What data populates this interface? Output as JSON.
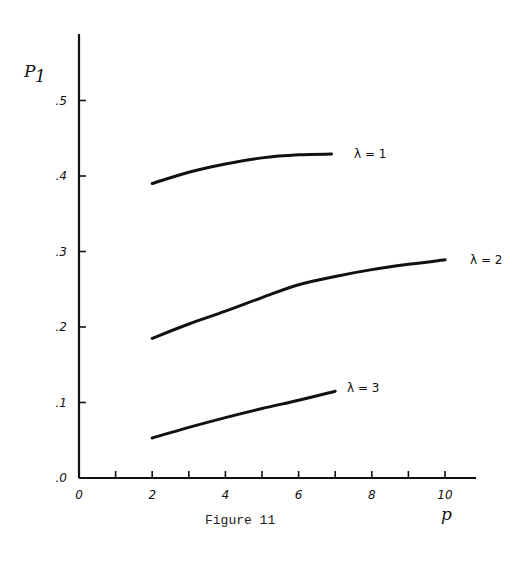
{
  "chart_data": {
    "type": "line",
    "title": "",
    "caption": "Figure 11",
    "xlabel": "p",
    "ylabel": "P1",
    "ylabel_main": "P",
    "ylabel_sub": "1",
    "xlim": [
      0,
      11
    ],
    "ylim": [
      0,
      0.58
    ],
    "grid": false,
    "x_ticks": [
      0,
      1,
      2,
      3,
      4,
      5,
      6,
      7,
      8,
      9,
      10
    ],
    "x_tick_labels": [
      "0",
      "",
      "2",
      "",
      "4",
      "",
      "6",
      "",
      "8",
      "",
      "10"
    ],
    "y_ticks": [
      0,
      0.1,
      0.2,
      0.3,
      0.4,
      0.5
    ],
    "y_tick_labels": [
      ".0",
      ".1",
      ".2",
      ".3",
      ".4",
      ".5"
    ],
    "series": [
      {
        "name": "λ = 1",
        "x": [
          2,
          3,
          4,
          5,
          6,
          6.9
        ],
        "values": [
          0.39,
          0.405,
          0.416,
          0.424,
          0.428,
          0.429
        ]
      },
      {
        "name": "λ = 2",
        "x": [
          2,
          3,
          4,
          5,
          6,
          7,
          8,
          9,
          10
        ],
        "values": [
          0.185,
          0.204,
          0.221,
          0.239,
          0.256,
          0.267,
          0.276,
          0.283,
          0.289
        ]
      },
      {
        "name": "λ = 3",
        "x": [
          2,
          3,
          4,
          5,
          6,
          7
        ],
        "values": [
          0.053,
          0.067,
          0.08,
          0.092,
          0.103,
          0.115
        ]
      }
    ],
    "annotations": [
      "λ = 1",
      "λ = 2",
      "λ = 3"
    ]
  }
}
